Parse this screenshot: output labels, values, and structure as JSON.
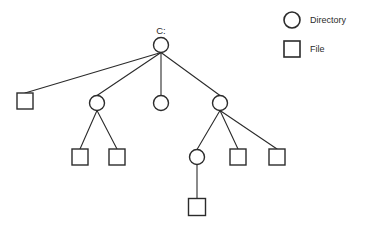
{
  "diagram": {
    "root_label": "C:",
    "stroke_color": "#2b2b2b",
    "fill_color": "#ffffff",
    "background_color": "#ffffff",
    "node_types": {
      "directory": "circle",
      "file": "square"
    },
    "nodes": [
      {
        "id": "n0",
        "type": "directory",
        "label": "C:",
        "level": 0,
        "x": 161,
        "y": 45,
        "r": 7.5
      },
      {
        "id": "n1",
        "type": "file",
        "label": "",
        "level": 1,
        "x": 25,
        "y": 101,
        "size": 16
      },
      {
        "id": "n2",
        "type": "directory",
        "label": "",
        "level": 1,
        "x": 97,
        "y": 103,
        "r": 7.5
      },
      {
        "id": "n3",
        "type": "directory",
        "label": "",
        "level": 1,
        "x": 161,
        "y": 103,
        "r": 7.5
      },
      {
        "id": "n4",
        "type": "directory",
        "label": "",
        "level": 1,
        "x": 220,
        "y": 103,
        "r": 7.5
      },
      {
        "id": "n5",
        "type": "file",
        "label": "",
        "level": 2,
        "x": 80,
        "y": 157,
        "size": 16
      },
      {
        "id": "n6",
        "type": "file",
        "label": "",
        "level": 2,
        "x": 117,
        "y": 157,
        "size": 16
      },
      {
        "id": "n7",
        "type": "directory",
        "label": "",
        "level": 2,
        "x": 197,
        "y": 157,
        "r": 7.5
      },
      {
        "id": "n8",
        "type": "file",
        "label": "",
        "level": 2,
        "x": 238,
        "y": 157,
        "size": 16
      },
      {
        "id": "n9",
        "type": "file",
        "label": "",
        "level": 2,
        "x": 277,
        "y": 157,
        "size": 16
      },
      {
        "id": "n10",
        "type": "file",
        "label": "",
        "level": 3,
        "x": 197,
        "y": 207,
        "size": 17
      }
    ],
    "edges": [
      {
        "from": "n0",
        "to": "n1"
      },
      {
        "from": "n0",
        "to": "n2"
      },
      {
        "from": "n0",
        "to": "n3"
      },
      {
        "from": "n0",
        "to": "n4"
      },
      {
        "from": "n2",
        "to": "n5"
      },
      {
        "from": "n2",
        "to": "n6"
      },
      {
        "from": "n4",
        "to": "n7"
      },
      {
        "from": "n4",
        "to": "n8"
      },
      {
        "from": "n4",
        "to": "n9"
      },
      {
        "from": "n7",
        "to": "n10"
      }
    ]
  },
  "legend": {
    "items": [
      {
        "shape": "circle",
        "label": "Directory",
        "icon_x": 292,
        "icon_y": 20,
        "r": 8,
        "text_x": 310,
        "text_y": 23
      },
      {
        "shape": "square",
        "label": "File",
        "icon_x": 292,
        "icon_y": 49,
        "size": 16,
        "text_x": 310,
        "text_y": 52
      }
    ]
  }
}
